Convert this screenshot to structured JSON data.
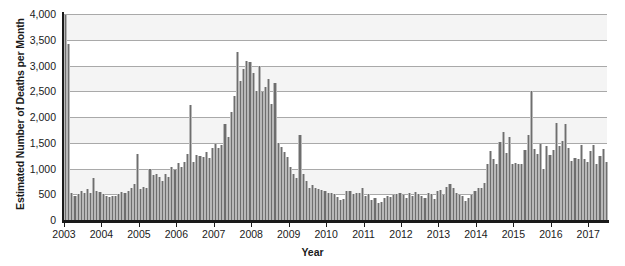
{
  "chart_data": {
    "type": "bar",
    "title": "",
    "xlabel": "Year",
    "ylabel": "Estimated Number of Deaths per Month",
    "ylim": [
      0,
      4000
    ],
    "yticks": [
      0,
      500,
      1000,
      1500,
      2000,
      2500,
      3000,
      3500,
      4000
    ],
    "ytick_labels": [
      "0",
      "500",
      "1,000",
      "1,500",
      "2,000",
      "2,500",
      "3,000",
      "3,500",
      "4,000"
    ],
    "xtick_labels": [
      "2003",
      "2004",
      "2005",
      "2006",
      "2007",
      "2008",
      "2009",
      "2010",
      "2011",
      "2012",
      "2013",
      "2014",
      "2015",
      "2016",
      "2017"
    ],
    "x_start_year": 2003,
    "x_unit": "month",
    "grid": "horizontal",
    "legend": "none",
    "bar_color": "#6e6e6e",
    "gridline_color": "#a9a9a9",
    "band_color": "#f4f4f4",
    "axis_color": "#1a1a1a",
    "n_points": 174,
    "categories": [
      "2003-01",
      "2003-02",
      "2003-03",
      "2003-04",
      "2003-05",
      "2003-06",
      "2003-07",
      "2003-08",
      "2003-09",
      "2003-10",
      "2003-11",
      "2003-12",
      "2004-01",
      "2004-02",
      "2004-03",
      "2004-04",
      "2004-05",
      "2004-06",
      "2004-07",
      "2004-08",
      "2004-09",
      "2004-10",
      "2004-11",
      "2004-12",
      "2005-01",
      "2005-02",
      "2005-03",
      "2005-04",
      "2005-05",
      "2005-06",
      "2005-07",
      "2005-08",
      "2005-09",
      "2005-10",
      "2005-11",
      "2005-12",
      "2006-01",
      "2006-02",
      "2006-03",
      "2006-04",
      "2006-05",
      "2006-06",
      "2006-07",
      "2006-08",
      "2006-09",
      "2006-10",
      "2006-11",
      "2006-12",
      "2007-01",
      "2007-02",
      "2007-03",
      "2007-04",
      "2007-05",
      "2007-06",
      "2007-07",
      "2007-08",
      "2007-09",
      "2007-10",
      "2007-11",
      "2007-12",
      "2008-01",
      "2008-02",
      "2008-03",
      "2008-04",
      "2008-05",
      "2008-06",
      "2008-07",
      "2008-08",
      "2008-09",
      "2008-10",
      "2008-11",
      "2008-12",
      "2009-01",
      "2009-02",
      "2009-03",
      "2009-04",
      "2009-05",
      "2009-06",
      "2009-07",
      "2009-08",
      "2009-09",
      "2009-10",
      "2009-11",
      "2009-12",
      "2010-01",
      "2010-02",
      "2010-03",
      "2010-04",
      "2010-05",
      "2010-06",
      "2010-07",
      "2010-08",
      "2010-09",
      "2010-10",
      "2010-11",
      "2010-12",
      "2011-01",
      "2011-02",
      "2011-03",
      "2011-04",
      "2011-05",
      "2011-06",
      "2011-07",
      "2011-08",
      "2011-09",
      "2011-10",
      "2011-11",
      "2011-12",
      "2012-01",
      "2012-02",
      "2012-03",
      "2012-04",
      "2012-05",
      "2012-06",
      "2012-07",
      "2012-08",
      "2012-09",
      "2012-10",
      "2012-11",
      "2012-12",
      "2013-01",
      "2013-02",
      "2013-03",
      "2013-04",
      "2013-05",
      "2013-06",
      "2013-07",
      "2013-08",
      "2013-09",
      "2013-10",
      "2013-11",
      "2013-12",
      "2014-01",
      "2014-02",
      "2014-03",
      "2014-04",
      "2014-05",
      "2014-06",
      "2014-07",
      "2014-08",
      "2014-09",
      "2014-10",
      "2014-11",
      "2014-12",
      "2015-01",
      "2015-02",
      "2015-03",
      "2015-04",
      "2015-05",
      "2015-06",
      "2015-07",
      "2015-08",
      "2015-09",
      "2015-10",
      "2015-11",
      "2015-12",
      "2016-01",
      "2016-02",
      "2016-03",
      "2016-04",
      "2016-05",
      "2016-06",
      "2016-07",
      "2016-08",
      "2016-09",
      "2016-10",
      "2016-11",
      "2016-12",
      "2017-01",
      "2017-02",
      "2017-03",
      "2017-04",
      "2017-05",
      "2017-06"
    ],
    "values": [
      3990,
      3420,
      520,
      470,
      500,
      560,
      520,
      600,
      530,
      820,
      560,
      540,
      500,
      470,
      440,
      460,
      470,
      500,
      540,
      520,
      560,
      620,
      700,
      1290,
      610,
      650,
      620,
      1000,
      880,
      900,
      830,
      760,
      900,
      830,
      1020,
      980,
      1110,
      1030,
      1120,
      1290,
      2230,
      1120,
      1270,
      1240,
      1220,
      1330,
      1200,
      1390,
      1480,
      1400,
      1460,
      1870,
      1620,
      2090,
      2400,
      3270,
      2700,
      2930,
      3080,
      3060,
      2860,
      2500,
      3000,
      2480,
      2590,
      2740,
      2260,
      2660,
      1500,
      1420,
      1320,
      1230,
      1020,
      900,
      820,
      1650,
      900,
      760,
      620,
      680,
      620,
      600,
      580,
      560,
      520,
      520,
      500,
      440,
      380,
      410,
      560,
      560,
      510,
      530,
      530,
      620,
      470,
      500,
      380,
      430,
      330,
      350,
      420,
      470,
      450,
      480,
      500,
      520,
      480,
      430,
      520,
      460,
      540,
      510,
      470,
      430,
      520,
      500,
      400,
      560,
      580,
      480,
      640,
      700,
      620,
      520,
      490,
      460,
      360,
      420,
      480,
      560,
      620,
      620,
      720,
      1080,
      1340,
      1180,
      1080,
      1520,
      1700,
      1300,
      1620,
      1080,
      1110,
      1080,
      1090,
      1350,
      1650,
      2510,
      1380,
      1290,
      1480,
      1000,
      1430,
      1260,
      1350,
      1880,
      1430,
      1540,
      1870,
      1390,
      1150,
      1200,
      1190,
      1450,
      1180,
      1120,
      1340,
      1450,
      1080,
      1250,
      1370,
      1130
    ]
  },
  "tooltip": {
    "note": ""
  }
}
